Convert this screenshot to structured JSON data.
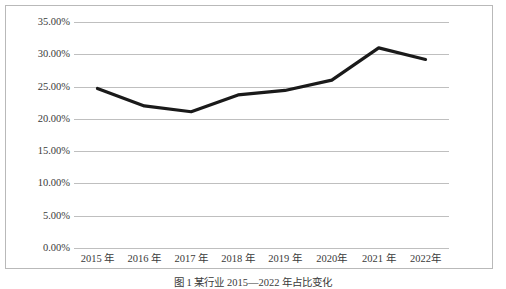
{
  "figure": {
    "caption": "图 1   某行业 2015—2022 年占比变化",
    "border_color": "#b9b9b9",
    "background": "#ffffff"
  },
  "chart_data": {
    "type": "line",
    "title": "",
    "xlabel": "",
    "ylabel": "",
    "categories": [
      "2015 年",
      "2016 年",
      "2017 年",
      "2018 年",
      "2019 年",
      "2020年",
      "2021 年",
      "2022年"
    ],
    "values": [
      24.7,
      22.0,
      21.1,
      23.7,
      24.4,
      26.0,
      31.0,
      29.2
    ],
    "value_labels": [
      "24.70%",
      "22.00%",
      "21.10%",
      "23.70%",
      "24.40%",
      "26.00%",
      "31.00%",
      "29.20%"
    ],
    "ylim": [
      0,
      35
    ],
    "ytick_values": [
      35,
      30,
      25,
      20,
      15,
      10,
      5,
      0
    ],
    "ytick_labels": [
      "35.00%",
      "30.00%",
      "25.00%",
      "20.00%",
      "15.00%",
      "10.00%",
      "5.00%",
      "0.00%"
    ],
    "grid": true,
    "grid_color": "#bfbfbf",
    "legend": false,
    "legend_position": "none",
    "series_color": "#1a1a1a",
    "series_width": 3.2,
    "markers": false
  }
}
